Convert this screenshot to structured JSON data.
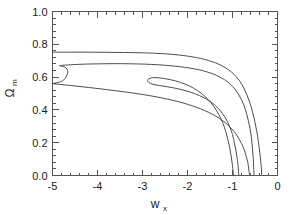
{
  "chart_data": {
    "type": "line",
    "title": "",
    "subtitle": "",
    "xlabel": "w",
    "xlabel_sub": "x",
    "ylabel": "Ω",
    "ylabel_sub": "m",
    "xlim": [
      -5.0,
      0.0
    ],
    "ylim": [
      0.0,
      1.0
    ],
    "grid": false,
    "legend": "none",
    "xticks": [
      -5,
      -4,
      -3,
      -2,
      -1,
      0
    ],
    "xtick_labels": [
      "-5",
      "-4",
      "-3",
      "-2",
      "-1",
      "0"
    ],
    "yticks": [
      0.0,
      0.2,
      0.4,
      0.6,
      0.8,
      1.0
    ],
    "ytick_labels": [
      "0.0",
      "0.2",
      "0.4",
      "0.6",
      "0.8",
      "1.0"
    ],
    "x_minor_per_major": 5,
    "y_minor_per_major": 5,
    "series": [
      {
        "name": "outer-contour",
        "points": [
          [
            -5.0,
            0.752
          ],
          [
            -4.6,
            0.752
          ],
          [
            -4.2,
            0.752
          ],
          [
            -3.8,
            0.751
          ],
          [
            -3.4,
            0.75
          ],
          [
            -3.0,
            0.748
          ],
          [
            -2.7,
            0.745
          ],
          [
            -2.45,
            0.741
          ],
          [
            -2.2,
            0.735
          ],
          [
            -2.0,
            0.728
          ],
          [
            -1.8,
            0.719
          ],
          [
            -1.62,
            0.708
          ],
          [
            -1.45,
            0.694
          ],
          [
            -1.3,
            0.678
          ],
          [
            -1.15,
            0.656
          ],
          [
            -1.02,
            0.63
          ],
          [
            -0.92,
            0.604
          ],
          [
            -0.83,
            0.572
          ],
          [
            -0.75,
            0.534
          ],
          [
            -0.68,
            0.492
          ],
          [
            -0.62,
            0.448
          ],
          [
            -0.57,
            0.402
          ],
          [
            -0.52,
            0.35
          ],
          [
            -0.48,
            0.296
          ],
          [
            -0.44,
            0.236
          ],
          [
            -0.41,
            0.175
          ],
          [
            -0.38,
            0.108
          ],
          [
            -0.36,
            0.048
          ],
          [
            -0.35,
            0.0
          ]
        ]
      },
      {
        "name": "middle-contour",
        "points": [
          [
            -5.0,
            0.56
          ],
          [
            -4.8,
            0.574
          ],
          [
            -4.72,
            0.592
          ],
          [
            -4.68,
            0.612
          ],
          [
            -4.66,
            0.632
          ],
          [
            -4.68,
            0.65
          ],
          [
            -4.74,
            0.663
          ],
          [
            -4.84,
            0.67
          ],
          [
            -4.6,
            0.675
          ],
          [
            -4.3,
            0.679
          ],
          [
            -3.95,
            0.681
          ],
          [
            -3.6,
            0.682
          ],
          [
            -3.25,
            0.681
          ],
          [
            -2.95,
            0.679
          ],
          [
            -2.65,
            0.675
          ],
          [
            -2.4,
            0.67
          ],
          [
            -2.15,
            0.663
          ],
          [
            -1.95,
            0.655
          ],
          [
            -1.75,
            0.645
          ],
          [
            -1.58,
            0.633
          ],
          [
            -1.42,
            0.618
          ],
          [
            -1.28,
            0.6
          ],
          [
            -1.15,
            0.579
          ],
          [
            -1.04,
            0.555
          ],
          [
            -0.95,
            0.528
          ],
          [
            -0.87,
            0.497
          ],
          [
            -0.8,
            0.462
          ],
          [
            -0.74,
            0.424
          ],
          [
            -0.69,
            0.382
          ],
          [
            -0.65,
            0.336
          ],
          [
            -0.61,
            0.286
          ],
          [
            -0.58,
            0.232
          ],
          [
            -0.56,
            0.174
          ],
          [
            -0.54,
            0.112
          ],
          [
            -0.53,
            0.05
          ],
          [
            -0.52,
            0.0
          ]
        ]
      },
      {
        "name": "middle-contour-lower",
        "points": [
          [
            -5.0,
            0.56
          ],
          [
            -4.6,
            0.549
          ],
          [
            -4.2,
            0.537
          ],
          [
            -3.8,
            0.524
          ],
          [
            -3.4,
            0.51
          ],
          [
            -3.0,
            0.494
          ],
          [
            -2.7,
            0.48
          ],
          [
            -2.45,
            0.466
          ],
          [
            -2.2,
            0.45
          ],
          [
            -2.0,
            0.434
          ],
          [
            -1.8,
            0.416
          ],
          [
            -1.62,
            0.396
          ],
          [
            -1.45,
            0.374
          ],
          [
            -1.3,
            0.35
          ],
          [
            -1.16,
            0.322
          ],
          [
            -1.05,
            0.294
          ],
          [
            -0.95,
            0.263
          ],
          [
            -0.87,
            0.23
          ],
          [
            -0.8,
            0.196
          ],
          [
            -0.74,
            0.158
          ],
          [
            -0.7,
            0.12
          ],
          [
            -0.66,
            0.08
          ],
          [
            -0.64,
            0.04
          ],
          [
            -0.62,
            0.0
          ]
        ]
      },
      {
        "name": "inner-contour",
        "points": [
          [
            -0.98,
            0.0
          ],
          [
            -1.0,
            0.06
          ],
          [
            -1.03,
            0.12
          ],
          [
            -1.07,
            0.18
          ],
          [
            -1.12,
            0.238
          ],
          [
            -1.18,
            0.294
          ],
          [
            -1.26,
            0.348
          ],
          [
            -1.36,
            0.398
          ],
          [
            -1.48,
            0.444
          ],
          [
            -1.62,
            0.484
          ],
          [
            -1.78,
            0.518
          ],
          [
            -1.96,
            0.546
          ],
          [
            -2.16,
            0.568
          ],
          [
            -2.36,
            0.583
          ],
          [
            -2.56,
            0.593
          ],
          [
            -2.72,
            0.597
          ],
          [
            -2.82,
            0.594
          ],
          [
            -2.88,
            0.585
          ],
          [
            -2.88,
            0.573
          ],
          [
            -2.82,
            0.561
          ],
          [
            -2.7,
            0.552
          ],
          [
            -2.54,
            0.545
          ],
          [
            -2.34,
            0.536
          ],
          [
            -2.12,
            0.523
          ],
          [
            -1.92,
            0.507
          ],
          [
            -1.74,
            0.488
          ],
          [
            -1.58,
            0.466
          ],
          [
            -1.44,
            0.44
          ],
          [
            -1.32,
            0.41
          ],
          [
            -1.22,
            0.376
          ],
          [
            -1.13,
            0.338
          ],
          [
            -1.06,
            0.296
          ],
          [
            -1.0,
            0.25
          ],
          [
            -0.96,
            0.2
          ],
          [
            -0.92,
            0.148
          ],
          [
            -0.89,
            0.092
          ],
          [
            -0.87,
            0.04
          ],
          [
            -0.86,
            0.0
          ]
        ]
      }
    ]
  },
  "axes": {
    "x_label_main": "w",
    "x_label_sub": "x",
    "y_label_main": "Ω",
    "y_label_sub": "m"
  },
  "style": {
    "contour_color": "#4d4d4d",
    "frame_color": "#555555",
    "text_color": "#1a1a1a",
    "background": "#ffffff"
  }
}
